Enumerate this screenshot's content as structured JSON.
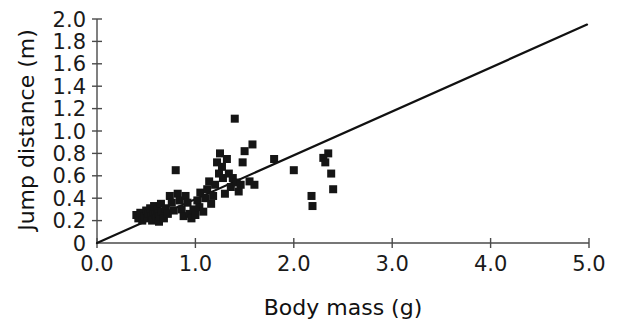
{
  "chart_data": {
    "type": "scatter",
    "title": "",
    "xlabel": "Body mass (g)",
    "ylabel": "Jump distance (m)",
    "xlim": [
      0.0,
      5.0
    ],
    "ylim": [
      0.0,
      2.0
    ],
    "grid": false,
    "legend": "none",
    "x_ticks": [
      0.0,
      1.0,
      2.0,
      3.0,
      4.0,
      5.0
    ],
    "x_tick_labels": [
      "0.0",
      "1.0",
      "2.0",
      "3.0",
      "4.0",
      "5.0"
    ],
    "y_ticks": [
      0.0,
      0.2,
      0.4,
      0.6,
      0.8,
      1.0,
      1.2,
      1.4,
      1.6,
      1.8,
      2.0
    ],
    "y_tick_labels": [
      "0",
      "0.2",
      "0.4",
      "0.6",
      "0.8",
      "1.0",
      "1.2",
      "1.4",
      "1.6",
      "1.8",
      "2.0"
    ],
    "marker": "square",
    "marker_color": "#151515",
    "marker_size_px": 8,
    "series": [
      {
        "name": "Jump distance vs body mass",
        "points": [
          [
            0.4,
            0.25
          ],
          [
            0.42,
            0.22
          ],
          [
            0.44,
            0.27
          ],
          [
            0.46,
            0.2
          ],
          [
            0.48,
            0.24
          ],
          [
            0.5,
            0.29
          ],
          [
            0.51,
            0.22
          ],
          [
            0.52,
            0.26
          ],
          [
            0.54,
            0.31
          ],
          [
            0.55,
            0.24
          ],
          [
            0.56,
            0.2
          ],
          [
            0.57,
            0.28
          ],
          [
            0.58,
            0.33
          ],
          [
            0.59,
            0.25
          ],
          [
            0.6,
            0.22
          ],
          [
            0.61,
            0.3
          ],
          [
            0.62,
            0.26
          ],
          [
            0.63,
            0.19
          ],
          [
            0.64,
            0.24
          ],
          [
            0.65,
            0.35
          ],
          [
            0.66,
            0.28
          ],
          [
            0.68,
            0.22
          ],
          [
            0.7,
            0.31
          ],
          [
            0.72,
            0.26
          ],
          [
            0.74,
            0.42
          ],
          [
            0.76,
            0.36
          ],
          [
            0.78,
            0.29
          ],
          [
            0.8,
            0.65
          ],
          [
            0.82,
            0.44
          ],
          [
            0.84,
            0.38
          ],
          [
            0.86,
            0.3
          ],
          [
            0.88,
            0.24
          ],
          [
            0.9,
            0.42
          ],
          [
            0.92,
            0.36
          ],
          [
            0.94,
            0.26
          ],
          [
            0.96,
            0.22
          ],
          [
            0.98,
            0.3
          ],
          [
            1.0,
            0.25
          ],
          [
            1.02,
            0.38
          ],
          [
            1.04,
            0.32
          ],
          [
            1.05,
            0.45
          ],
          [
            1.08,
            0.28
          ],
          [
            1.1,
            0.4
          ],
          [
            1.12,
            0.48
          ],
          [
            1.14,
            0.55
          ],
          [
            1.16,
            0.35
          ],
          [
            1.18,
            0.42
          ],
          [
            1.2,
            0.52
          ],
          [
            1.22,
            0.72
          ],
          [
            1.24,
            0.62
          ],
          [
            1.25,
            0.8
          ],
          [
            1.27,
            0.68
          ],
          [
            1.28,
            0.58
          ],
          [
            1.3,
            0.44
          ],
          [
            1.32,
            0.75
          ],
          [
            1.34,
            0.62
          ],
          [
            1.36,
            0.5
          ],
          [
            1.38,
            0.58
          ],
          [
            1.4,
            1.11
          ],
          [
            1.42,
            0.54
          ],
          [
            1.44,
            0.46
          ],
          [
            1.46,
            0.52
          ],
          [
            1.48,
            0.72
          ],
          [
            1.5,
            0.82
          ],
          [
            1.55,
            0.55
          ],
          [
            1.58,
            0.88
          ],
          [
            1.6,
            0.52
          ],
          [
            1.8,
            0.75
          ],
          [
            2.0,
            0.65
          ],
          [
            2.18,
            0.42
          ],
          [
            2.19,
            0.33
          ],
          [
            2.3,
            0.76
          ],
          [
            2.32,
            0.72
          ],
          [
            2.35,
            0.8
          ],
          [
            2.38,
            0.62
          ],
          [
            2.4,
            0.48
          ]
        ]
      }
    ],
    "trend_line": {
      "type": "linear-fit",
      "x_start": 0.0,
      "y_start": 0.0,
      "x_end": 4.98,
      "y_end": 1.95,
      "slope": 0.392,
      "intercept": 0.0,
      "color": "#111111"
    }
  }
}
